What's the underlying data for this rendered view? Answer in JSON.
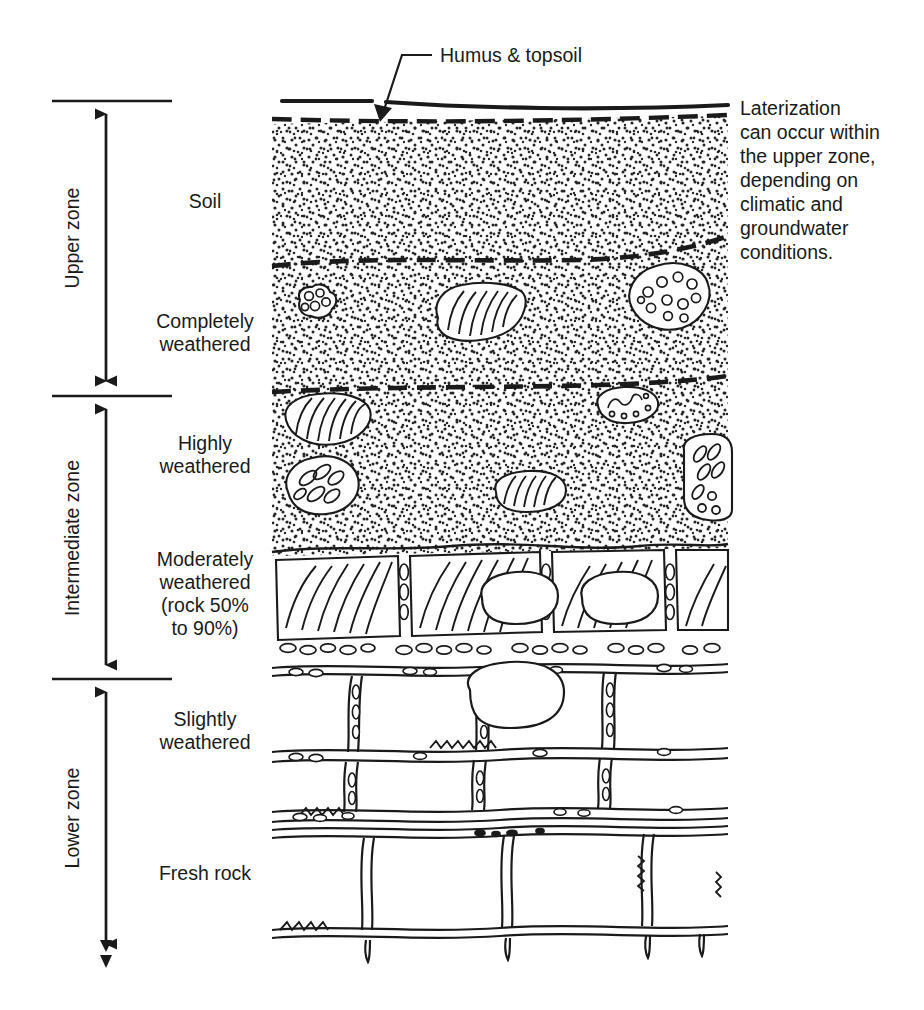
{
  "diagram": {
    "callout": {
      "label": "Humus & topsoil"
    },
    "note": {
      "text": "Laterization\ncan occur within\nthe upper zone,\ndepending on\nclimatic and\ngroundwater\nconditions."
    },
    "zones": [
      {
        "id": "upper",
        "label": "Upper zone"
      },
      {
        "id": "intermediate",
        "label": "Intermediate zone"
      },
      {
        "id": "lower",
        "label": "Lower zone"
      }
    ],
    "layers": [
      {
        "id": "soil",
        "label": "Soil"
      },
      {
        "id": "completely-weathered",
        "label": "Completely\nweathered"
      },
      {
        "id": "highly-weathered",
        "label": "Highly\nweathered"
      },
      {
        "id": "moderately-weathered",
        "label": "Moderately\nweathered\n(rock 50%\nto 90%)"
      },
      {
        "id": "slightly-weathered",
        "label": "Slightly\nweathered"
      },
      {
        "id": "fresh-rock",
        "label": "Fresh rock"
      }
    ],
    "caption": {
      "text": ""
    },
    "colors": {
      "ink": "#1a1a1a",
      "background": "#ffffff"
    }
  }
}
